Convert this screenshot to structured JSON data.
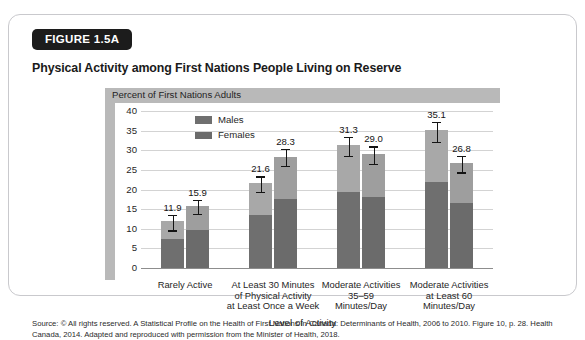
{
  "figure": {
    "badge": "FIGURE 1.5A",
    "title": "Physical Activity among First Nations People Living on Reserve",
    "panel_header": "Percent of First Nations Adults",
    "source": "Source: © All rights reserved. A Statistical Profile on the Health of First Nations in Canada: Determinants of Health, 2006 to 2010. Figure 10, p. 28. Health Canada, 2014. Adapted and reproduced with permission from the Minister of Health, 2018."
  },
  "colors": {
    "males_bar": "#6f6f6f",
    "females_bar": "#6b6b6b",
    "bar_highlight": "#a8a8a8",
    "band": "#b9b9b9",
    "gridline": "#d3d3d3",
    "badge_bg": "#1c1c1c",
    "card_border": "#c9c9cd"
  },
  "chart_data": {
    "type": "bar",
    "title": "Physical Activity among First Nations People Living on Reserve",
    "subtitle": "Percent of First Nations Adults",
    "xlabel": "Level of Activity",
    "ylabel": "Percent of First Nations Adults",
    "ylim": [
      0,
      40
    ],
    "yticks": [
      0,
      5,
      10,
      15,
      20,
      25,
      30,
      35,
      40
    ],
    "ytick_labels": [
      "0",
      "5",
      "10",
      "15",
      "20",
      "25",
      "30",
      "35",
      "40"
    ],
    "grid": true,
    "legend_position": "top-left",
    "categories": [
      "Rarely Active",
      "At Least 30 Minutes of Physical Activity at Least Once a Week",
      "Moderate Activities 35–59 Minutes/Day",
      "Moderate Activities at Least 60 Minutes/Day"
    ],
    "category_lines": [
      [
        "Rarely Active"
      ],
      [
        "At Least 30 Minutes",
        "of Physical Activity",
        "at Least Once a Week"
      ],
      [
        "Moderate Activities",
        "35–59",
        "Minutes/Day"
      ],
      [
        "Moderate Activities",
        "at Least 60",
        "Minutes/Day"
      ]
    ],
    "series": [
      {
        "name": "Males",
        "values": [
          11.9,
          21.6,
          31.3,
          35.1
        ],
        "labels": [
          "11.9",
          "21.6",
          "31.3",
          "35.1"
        ],
        "error_low": [
          9.6,
          19.4,
          28.6,
          32.2
        ],
        "error_high": [
          13.6,
          23.4,
          33.4,
          37.2
        ]
      },
      {
        "name": "Females",
        "values": [
          15.9,
          28.3,
          29.0,
          26.8
        ],
        "labels": [
          "15.9",
          "28.3",
          "29.0",
          "26.8"
        ],
        "error_low": [
          13.8,
          26.0,
          26.6,
          24.4
        ],
        "error_high": [
          17.4,
          30.4,
          31.0,
          28.6
        ]
      }
    ]
  }
}
